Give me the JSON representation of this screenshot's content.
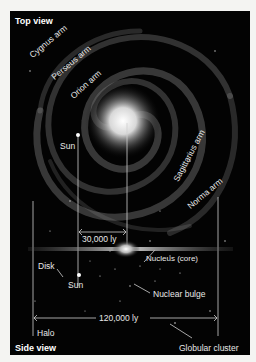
{
  "diagram": {
    "top_view": {
      "title": "Top view",
      "arms": [
        "Cygnus arm",
        "Perseus arm",
        "Orion arm",
        "Sagittarius arm",
        "Norma arm"
      ],
      "sun_label": "Sun",
      "distance_label": "30,000 ly"
    },
    "side_view": {
      "title": "Side view",
      "labels": {
        "nucleus": "Nucleus (core)",
        "disk": "Disk",
        "sun": "Sun",
        "bulge": "Nuclear bulge",
        "halo": "Halo",
        "globular": "Globular cluster"
      },
      "diameter_label": "120,000 ly"
    },
    "colors": {
      "background": "#030303",
      "page": "#f4f4f2",
      "text": "#e8e8e8",
      "lines": "#cfcfcf"
    }
  }
}
